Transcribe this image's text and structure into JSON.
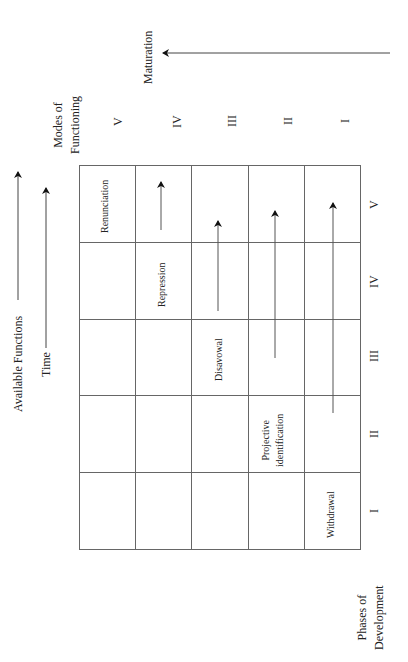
{
  "diagram": {
    "orientation": "rotated 90 degrees counter-clockwise",
    "axes": {
      "available_functions": "Available Functions",
      "time": "Time",
      "maturation": "Maturation",
      "modes_line1": "Modes of",
      "modes_line2": "Functioning",
      "phases_line1": "Phases of",
      "phases_line2": "Development"
    },
    "modes_of_functioning": [
      "V",
      "IV",
      "III",
      "II",
      "I"
    ],
    "phases_of_development": [
      "V",
      "IV",
      "III",
      "II",
      "I"
    ],
    "cells": {
      "renunciation": "Renunciation",
      "repression": "Repression",
      "disavowal": "Disavowal",
      "projective_line1": "Projective",
      "projective_line2": "identification",
      "withdrawal": "Withdrawal"
    },
    "grid": {
      "rows": 5,
      "columns": 5
    },
    "colors": {
      "line": "#555555",
      "text": "#222222",
      "background": "#ffffff"
    }
  }
}
